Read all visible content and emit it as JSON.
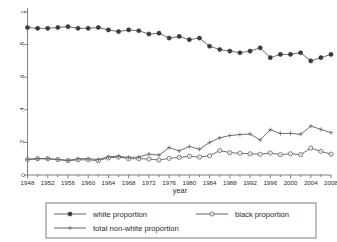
{
  "chart_data": {
    "type": "line",
    "title": "",
    "xlabel": "year",
    "ylabel": "",
    "xlim": [
      1948,
      2008
    ],
    "ylim": [
      0,
      1
    ],
    "grid": false,
    "legend_position": "bottom",
    "x": [
      1948,
      1950,
      1952,
      1954,
      1956,
      1958,
      1960,
      1962,
      1964,
      1966,
      1968,
      1970,
      1972,
      1974,
      1976,
      1978,
      1980,
      1982,
      1984,
      1986,
      1988,
      1990,
      1992,
      1994,
      1996,
      1998,
      2000,
      2002,
      2004,
      2006,
      2008
    ],
    "xticks": [
      1948,
      1952,
      1956,
      1960,
      1964,
      1968,
      1972,
      1976,
      1980,
      1984,
      1988,
      1992,
      1996,
      2000,
      2004,
      2008
    ],
    "xtick_labels": [
      "1948",
      "1952",
      "1956",
      "1960",
      "1964",
      "1968",
      "1972",
      "1976",
      "1980",
      "1984",
      "1988",
      "1992",
      "1996",
      "2000",
      "2004",
      "2008"
    ],
    "yticks": [
      0,
      0.2,
      0.4,
      0.6,
      0.8,
      1
    ],
    "ytick_labels": [
      "0",
      ".2",
      ".4",
      ".6",
      ".8",
      "1"
    ],
    "series": [
      {
        "name": "white proportion",
        "marker": "filled-circle",
        "values": [
          0.905,
          0.9,
          0.9,
          0.905,
          0.91,
          0.9,
          0.9,
          0.905,
          0.89,
          0.88,
          0.89,
          0.885,
          0.865,
          0.87,
          0.84,
          0.85,
          0.83,
          0.84,
          0.79,
          0.77,
          0.76,
          0.75,
          0.76,
          0.78,
          0.72,
          0.74,
          0.74,
          0.75,
          0.7,
          0.72,
          0.74
        ]
      },
      {
        "name": "black proportion",
        "marker": "open-circle",
        "values": [
          0.095,
          0.1,
          0.1,
          0.095,
          0.088,
          0.093,
          0.093,
          0.088,
          0.105,
          0.11,
          0.1,
          0.1,
          0.098,
          0.092,
          0.102,
          0.108,
          0.115,
          0.11,
          0.118,
          0.15,
          0.137,
          0.133,
          0.13,
          0.127,
          0.135,
          0.125,
          0.13,
          0.125,
          0.165,
          0.145,
          0.128
        ]
      },
      {
        "name": "total non-white proportion",
        "marker": "plus",
        "values": [
          0.095,
          0.1,
          0.1,
          0.095,
          0.09,
          0.1,
          0.1,
          0.095,
          0.112,
          0.115,
          0.108,
          0.11,
          0.128,
          0.122,
          0.168,
          0.148,
          0.175,
          0.158,
          0.2,
          0.228,
          0.242,
          0.248,
          0.252,
          0.215,
          0.278,
          0.255,
          0.255,
          0.25,
          0.3,
          0.28,
          0.26
        ]
      }
    ]
  },
  "legend": {
    "entries": [
      {
        "label": "white proportion",
        "marker": "filled-circle"
      },
      {
        "label": "black proportion",
        "marker": "open-circle"
      },
      {
        "label": "total non-white proportion",
        "marker": "plus"
      }
    ]
  },
  "axes": {
    "x_title": "year"
  }
}
